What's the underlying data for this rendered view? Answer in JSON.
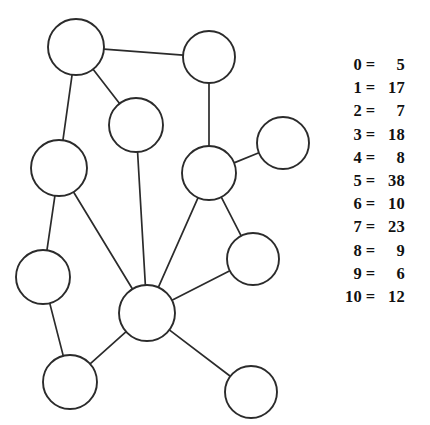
{
  "figure": {
    "background_color": "#ffffff",
    "stroke_color": "#2b2b2b",
    "node_fill": "#ffffff"
  },
  "graph": {
    "node_count": 11,
    "edge_count": 13,
    "nodes": [
      {
        "id": "0",
        "cx": 76,
        "cy": 47,
        "r": 28
      },
      {
        "id": "1",
        "cx": 209,
        "cy": 57,
        "r": 26
      },
      {
        "id": "2",
        "cx": 136,
        "cy": 125,
        "r": 27
      },
      {
        "id": "3",
        "cx": 283,
        "cy": 143,
        "r": 26
      },
      {
        "id": "4",
        "cx": 59,
        "cy": 168,
        "r": 28
      },
      {
        "id": "5",
        "cx": 209,
        "cy": 173,
        "r": 27
      },
      {
        "id": "6",
        "cx": 253,
        "cy": 259,
        "r": 26
      },
      {
        "id": "7",
        "cx": 43,
        "cy": 277,
        "r": 27
      },
      {
        "id": "8",
        "cx": 147,
        "cy": 313,
        "r": 28
      },
      {
        "id": "9",
        "cx": 70,
        "cy": 382,
        "r": 27
      },
      {
        "id": "10",
        "cx": 251,
        "cy": 392,
        "r": 26
      }
    ],
    "edges": [
      {
        "from": "0",
        "to": "1"
      },
      {
        "from": "0",
        "to": "2"
      },
      {
        "from": "0",
        "to": "4"
      },
      {
        "from": "1",
        "to": "5"
      },
      {
        "from": "2",
        "to": "8"
      },
      {
        "from": "3",
        "to": "5"
      },
      {
        "from": "4",
        "to": "7"
      },
      {
        "from": "4",
        "to": "8"
      },
      {
        "from": "5",
        "to": "6"
      },
      {
        "from": "5",
        "to": "8"
      },
      {
        "from": "6",
        "to": "8"
      },
      {
        "from": "7",
        "to": "9"
      },
      {
        "from": "8",
        "to": "9"
      },
      {
        "from": "8",
        "to": "10"
      }
    ]
  },
  "legend": {
    "separator": "=",
    "rows": [
      {
        "key": "0",
        "value": "5"
      },
      {
        "key": "1",
        "value": "17"
      },
      {
        "key": "2",
        "value": "7"
      },
      {
        "key": "3",
        "value": "18"
      },
      {
        "key": "4",
        "value": "8"
      },
      {
        "key": "5",
        "value": "38"
      },
      {
        "key": "6",
        "value": "10"
      },
      {
        "key": "7",
        "value": "23"
      },
      {
        "key": "8",
        "value": "9"
      },
      {
        "key": "9",
        "value": "6"
      },
      {
        "key": "10",
        "value": "12"
      }
    ]
  }
}
